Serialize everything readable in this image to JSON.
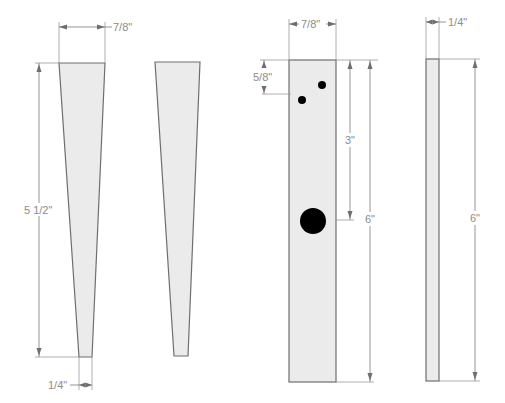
{
  "diagram": {
    "type": "woodworking part drawing",
    "parts": [
      {
        "id": "tapered-leg-1",
        "shape": "tapered",
        "dimensions": {
          "top_width": "7/8\"",
          "length": "5 1/2\"",
          "bottom_width": "1/4\""
        }
      },
      {
        "id": "tapered-leg-2",
        "shape": "tapered",
        "dimensions": {}
      },
      {
        "id": "drilled-board",
        "shape": "rectangle",
        "dimensions": {
          "width": "7/8\"",
          "small_hole_offset": "5/8\"",
          "large_hole_offset": "3\"",
          "length": "6\""
        },
        "holes": [
          {
            "size": "small",
            "label": "small-hole-1"
          },
          {
            "size": "small",
            "label": "small-hole-2"
          },
          {
            "size": "large",
            "label": "large-hole"
          }
        ]
      },
      {
        "id": "thin-strip",
        "shape": "rectangle",
        "dimensions": {
          "thickness": "1/4\"",
          "length": "6\""
        }
      }
    ]
  },
  "labels": {
    "leg_top_width": "7/8\"",
    "leg_length": "5 1/2\"",
    "leg_bottom_width": "1/4\"",
    "board_width": "7/8\"",
    "board_hole_offset": "5/8\"",
    "board_large_hole": "3\"",
    "board_length": "6\"",
    "strip_thickness": "1/4\"",
    "strip_length": "6\""
  },
  "colors": {
    "piece_fill": "#ebebeb",
    "piece_stroke": "#6e6e6e",
    "dimension_line": "#8a8a8a",
    "label_text": "#8c8c8c",
    "hole": "#000000"
  }
}
